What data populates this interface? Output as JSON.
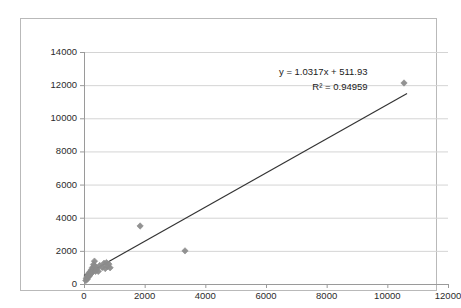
{
  "chart_data": {
    "type": "scatter",
    "title": "",
    "xlabel": "",
    "ylabel": "",
    "xlim": [
      0,
      12000
    ],
    "ylim": [
      0,
      14000
    ],
    "x_ticks": [
      0,
      2000,
      4000,
      6000,
      8000,
      10000,
      12000
    ],
    "y_ticks": [
      0,
      2000,
      4000,
      6000,
      8000,
      10000,
      12000,
      14000
    ],
    "x_tick_labels": [
      "0",
      "2000",
      "4000",
      "6000",
      "8000",
      "10000",
      "12000"
    ],
    "y_tick_labels": [
      "0",
      "2000",
      "4000",
      "6000",
      "8000",
      "10000",
      "12000",
      "14000"
    ],
    "grid": "horizontal",
    "legend": "none",
    "marker": "diamond",
    "marker_color": "#8c8c8c",
    "trendline_color": "#333333",
    "gridline_color": "#d4d4d4",
    "axis_color": "#9a9a9a",
    "points": [
      [
        60,
        210
      ],
      [
        75,
        330
      ],
      [
        95,
        420
      ],
      [
        110,
        300
      ],
      [
        130,
        520
      ],
      [
        150,
        610
      ],
      [
        165,
        450
      ],
      [
        180,
        700
      ],
      [
        200,
        560
      ],
      [
        215,
        760
      ],
      [
        235,
        640
      ],
      [
        250,
        880
      ],
      [
        265,
        700
      ],
      [
        280,
        1000
      ],
      [
        300,
        820
      ],
      [
        315,
        1180
      ],
      [
        330,
        930
      ],
      [
        345,
        1380
      ],
      [
        360,
        1080
      ],
      [
        380,
        760
      ],
      [
        420,
        900
      ],
      [
        470,
        760
      ],
      [
        520,
        1120
      ],
      [
        600,
        1000
      ],
      [
        660,
        1250
      ],
      [
        700,
        930
      ],
      [
        740,
        1290
      ],
      [
        780,
        1060
      ],
      [
        820,
        1200
      ],
      [
        860,
        980
      ],
      [
        1850,
        3500
      ],
      [
        3330,
        2000
      ],
      [
        10550,
        12130
      ]
    ],
    "trendline": {
      "equation_label": "y = 1.0317x + 511.93",
      "r2_label": "R² = 0.94959",
      "slope": 1.0317,
      "intercept": 511.93,
      "r_squared": 0.94959,
      "x_start": 0,
      "x_end": 10650
    }
  }
}
